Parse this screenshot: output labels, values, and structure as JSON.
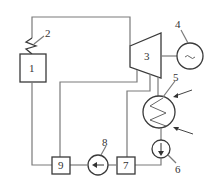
{
  "diagram": {
    "type": "power-plant-schematic",
    "components": [
      {
        "id": "1",
        "label": "1",
        "shape": "box"
      },
      {
        "id": "2",
        "label": "2",
        "shape": "heater-coil"
      },
      {
        "id": "3",
        "label": "3",
        "shape": "turbine"
      },
      {
        "id": "4",
        "label": "4",
        "shape": "generator",
        "symbol": "~"
      },
      {
        "id": "5",
        "label": "5",
        "shape": "condenser"
      },
      {
        "id": "6",
        "label": "6",
        "shape": "pump"
      },
      {
        "id": "7",
        "label": "7",
        "shape": "box"
      },
      {
        "id": "8",
        "label": "8",
        "shape": "pump"
      },
      {
        "id": "9",
        "label": "9",
        "shape": "box"
      }
    ],
    "colors": {
      "line": "#7a7a7a",
      "outline": "#3a3a3a",
      "background": "#ffffff"
    }
  }
}
